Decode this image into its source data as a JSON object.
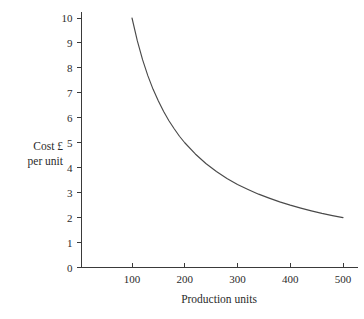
{
  "chart_data": {
    "type": "line",
    "title": "",
    "subtitle": "",
    "xlabel": "Production units",
    "ylabel_line1": "Cost £",
    "ylabel_line2": "per unit",
    "ylabel": "Cost £ per unit",
    "xlim": [
      0,
      520
    ],
    "ylim": [
      0,
      10
    ],
    "grid": false,
    "legend": false,
    "legend_position": "none",
    "x_ticks": [
      100,
      200,
      300,
      400,
      500
    ],
    "x_tick_labels": [
      "100",
      "200",
      "300",
      "400",
      "500"
    ],
    "y_ticks": [
      0,
      1,
      2,
      3,
      4,
      5,
      6,
      7,
      8,
      9,
      10
    ],
    "y_tick_labels": [
      "0",
      "1",
      "2",
      "3",
      "4",
      "5",
      "6",
      "7",
      "8",
      "9",
      "10"
    ],
    "annotations": [],
    "series": [
      {
        "name": "Cost per unit",
        "color": "#4a4a4a",
        "x": [
          100,
          110,
          120,
          130,
          140,
          150,
          160,
          170,
          180,
          190,
          200,
          220,
          240,
          260,
          280,
          300,
          320,
          340,
          360,
          380,
          400,
          420,
          440,
          460,
          480,
          500
        ],
        "values": [
          10.0,
          9.09,
          8.33,
          7.69,
          7.14,
          6.67,
          6.25,
          5.88,
          5.56,
          5.26,
          5.0,
          4.55,
          4.17,
          3.85,
          3.57,
          3.33,
          3.13,
          2.94,
          2.78,
          2.63,
          2.5,
          2.38,
          2.27,
          2.17,
          2.08,
          2.0
        ]
      }
    ]
  },
  "figure": {
    "background_color": "#ffffff",
    "axis_color": "#3a3a3a",
    "text_color": "#2b2b2b"
  }
}
